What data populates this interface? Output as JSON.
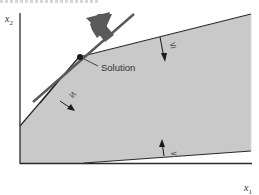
{
  "figure": {
    "header_fragment": "",
    "axes": {
      "x_label": "x",
      "x_subscript": "1",
      "y_label": "x",
      "y_subscript": "2"
    },
    "annotations": {
      "solution_label": "Solution",
      "ineq_top": "≤",
      "ineq_left": "≤",
      "ineq_bottom": "≤"
    },
    "colors": {
      "feasible_region": "#c8c8c8",
      "lines": "#2a2a2a",
      "objective_line": "#555555",
      "objective_arrow": "#5a5a5a"
    }
  }
}
